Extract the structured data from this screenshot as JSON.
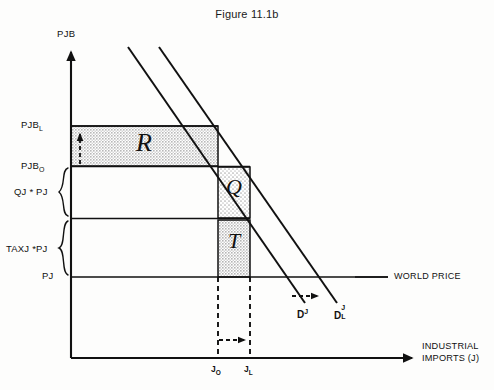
{
  "figure": {
    "title": "Figure 11.1b"
  },
  "axes": {
    "y_title": "PJB",
    "x_title_line1": "INDUSTRIAL",
    "x_title_line2": "IMPORTS (J)"
  },
  "y_labels": [
    {
      "id": "pjb-l",
      "base": "PJB",
      "sub": "L"
    },
    {
      "id": "pjb-o",
      "base": "PJB",
      "sub": "O"
    },
    {
      "id": "qj-pj",
      "base": "QJ * PJ",
      "sub": ""
    },
    {
      "id": "taxj-pj",
      "base": "TAXJ *PJ",
      "sub": ""
    },
    {
      "id": "pj",
      "base": "PJ",
      "sub": ""
    }
  ],
  "x_labels": [
    {
      "id": "j-o",
      "base": "J",
      "sub": "O"
    },
    {
      "id": "j-l",
      "base": "J",
      "sub": "L"
    }
  ],
  "regions": [
    {
      "id": "region-r",
      "letter": "R"
    },
    {
      "id": "region-q",
      "letter": "Q"
    },
    {
      "id": "region-t",
      "letter": "T"
    }
  ],
  "annotations": {
    "world_price": "WORLD PRICE",
    "demand_original_base": "D",
    "demand_original_sup": "J",
    "demand_liberal_base": "D",
    "demand_liberal_sup": "J",
    "demand_liberal_sub": "L"
  },
  "colors": {
    "ink": "#111111",
    "shade_dark": "#bdbdbd",
    "shade_light": "#e0e0e0",
    "background": "#fdfdfc"
  }
}
